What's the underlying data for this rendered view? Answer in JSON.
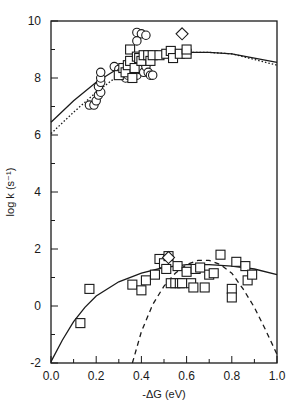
{
  "chart_data": {
    "type": "scatter",
    "title": "",
    "xlabel": "-ΔG (eV)",
    "ylabel": "log k (s⁻¹)",
    "xlim": [
      0.0,
      1.0
    ],
    "ylim": [
      -2,
      10
    ],
    "grid": false,
    "legend": null,
    "x_ticks": [
      0.0,
      0.2,
      0.4,
      0.6,
      0.8,
      1.0
    ],
    "x_tick_labels": [
      "0.0",
      "0.2",
      "0.4",
      "0.6",
      "0.8",
      "1.0"
    ],
    "x_minor_ticks": [
      0.1,
      0.3,
      0.5,
      0.7,
      0.9
    ],
    "y_ticks": [
      -2,
      0,
      2,
      4,
      6,
      8,
      10
    ],
    "y_tick_labels": [
      "-2",
      "0",
      "2",
      "4",
      "6",
      "8",
      "10"
    ],
    "y_minor_ticks": [
      -1,
      1,
      3,
      5,
      7,
      9
    ],
    "series": [
      {
        "name": "upper circles",
        "marker": "circle",
        "points": [
          [
            0.17,
            7.05
          ],
          [
            0.19,
            7.05
          ],
          [
            0.2,
            7.2
          ],
          [
            0.21,
            7.4
          ],
          [
            0.22,
            7.5
          ],
          [
            0.21,
            7.7
          ],
          [
            0.22,
            7.85
          ],
          [
            0.22,
            8.0
          ],
          [
            0.22,
            8.2
          ],
          [
            0.28,
            8.4
          ],
          [
            0.3,
            8.3
          ],
          [
            0.31,
            8.2
          ],
          [
            0.33,
            8.0
          ],
          [
            0.38,
            9.6
          ],
          [
            0.4,
            9.55
          ],
          [
            0.42,
            9.5
          ],
          [
            0.38,
            9.3
          ],
          [
            0.36,
            8.3
          ],
          [
            0.38,
            8.1
          ],
          [
            0.39,
            8.3
          ],
          [
            0.41,
            8.2
          ],
          [
            0.42,
            8.4
          ],
          [
            0.43,
            8.2
          ],
          [
            0.44,
            8.1
          ],
          [
            0.45,
            8.1
          ],
          [
            0.34,
            8.1
          ]
        ]
      },
      {
        "name": "upper squares",
        "marker": "square",
        "points": [
          [
            0.3,
            8.1
          ],
          [
            0.32,
            8.35
          ],
          [
            0.33,
            8.2
          ],
          [
            0.34,
            8.45
          ],
          [
            0.35,
            8.6
          ],
          [
            0.36,
            8.0
          ],
          [
            0.35,
            9.0
          ],
          [
            0.37,
            8.35
          ],
          [
            0.38,
            8.75
          ],
          [
            0.39,
            8.7
          ],
          [
            0.4,
            8.6
          ],
          [
            0.41,
            8.8
          ],
          [
            0.43,
            8.8
          ],
          [
            0.44,
            8.6
          ],
          [
            0.45,
            8.8
          ],
          [
            0.48,
            8.8
          ],
          [
            0.51,
            8.85
          ],
          [
            0.53,
            8.95
          ],
          [
            0.54,
            8.7
          ],
          [
            0.57,
            8.85
          ],
          [
            0.6,
            8.85
          ],
          [
            0.6,
            9.0
          ]
        ]
      },
      {
        "name": "upper diamond",
        "marker": "diamond",
        "points": [
          [
            0.58,
            9.55
          ]
        ]
      },
      {
        "name": "lower squares",
        "marker": "square",
        "points": [
          [
            0.13,
            -0.6
          ],
          [
            0.17,
            0.6
          ],
          [
            0.36,
            0.75
          ],
          [
            0.4,
            0.55
          ],
          [
            0.42,
            0.9
          ],
          [
            0.46,
            1.1
          ],
          [
            0.48,
            1.65
          ],
          [
            0.5,
            1.5
          ],
          [
            0.51,
            1.3
          ],
          [
            0.52,
            1.75
          ],
          [
            0.53,
            0.8
          ],
          [
            0.55,
            0.8
          ],
          [
            0.56,
            1.4
          ],
          [
            0.57,
            0.8
          ],
          [
            0.58,
            0.8
          ],
          [
            0.6,
            1.2
          ],
          [
            0.62,
            0.8
          ],
          [
            0.63,
            0.65
          ],
          [
            0.64,
            1.3
          ],
          [
            0.66,
            1.35
          ],
          [
            0.68,
            0.65
          ],
          [
            0.7,
            1.1
          ],
          [
            0.72,
            1.15
          ],
          [
            0.75,
            1.8
          ],
          [
            0.8,
            0.6
          ],
          [
            0.8,
            0.3
          ],
          [
            0.82,
            1.55
          ],
          [
            0.86,
            1.4
          ],
          [
            0.87,
            0.9
          ],
          [
            0.89,
            1.1
          ]
        ]
      },
      {
        "name": "lower diamond",
        "marker": "diamond",
        "points": [
          [
            0.52,
            1.7
          ]
        ]
      }
    ],
    "curves": [
      {
        "name": "upper fit (solid)",
        "style": "solid",
        "points": [
          [
            0.0,
            6.45
          ],
          [
            0.1,
            7.2
          ],
          [
            0.2,
            7.85
          ],
          [
            0.3,
            8.35
          ],
          [
            0.4,
            8.65
          ],
          [
            0.5,
            8.85
          ],
          [
            0.6,
            8.9
          ],
          [
            0.7,
            8.9
          ],
          [
            0.8,
            8.85
          ],
          [
            0.9,
            8.7
          ],
          [
            1.0,
            8.55
          ]
        ]
      },
      {
        "name": "upper fit (dotted)",
        "style": "dotted",
        "points": [
          [
            0.0,
            6.05
          ],
          [
            0.1,
            6.8
          ],
          [
            0.2,
            7.5
          ],
          [
            0.3,
            8.1
          ],
          [
            0.4,
            8.55
          ],
          [
            0.5,
            8.8
          ],
          [
            0.6,
            8.9
          ],
          [
            0.7,
            8.9
          ],
          [
            0.8,
            8.85
          ],
          [
            0.9,
            8.65
          ],
          [
            1.0,
            8.45
          ]
        ]
      },
      {
        "name": "lower fit (solid)",
        "style": "solid",
        "points": [
          [
            0.0,
            -1.95
          ],
          [
            0.05,
            -1.2
          ],
          [
            0.1,
            -0.55
          ],
          [
            0.15,
            -0.05
          ],
          [
            0.2,
            0.35
          ],
          [
            0.3,
            0.85
          ],
          [
            0.4,
            1.15
          ],
          [
            0.5,
            1.35
          ],
          [
            0.6,
            1.45
          ],
          [
            0.7,
            1.45
          ],
          [
            0.8,
            1.4
          ],
          [
            0.9,
            1.3
          ],
          [
            1.0,
            1.1
          ]
        ]
      },
      {
        "name": "lower fit (dashed)",
        "style": "dashed",
        "points": [
          [
            0.36,
            -2.0
          ],
          [
            0.4,
            -0.9
          ],
          [
            0.45,
            0.05
          ],
          [
            0.5,
            0.7
          ],
          [
            0.55,
            1.15
          ],
          [
            0.6,
            1.45
          ],
          [
            0.65,
            1.6
          ],
          [
            0.7,
            1.6
          ],
          [
            0.75,
            1.45
          ],
          [
            0.8,
            1.15
          ],
          [
            0.85,
            0.6
          ],
          [
            0.9,
            -0.05
          ],
          [
            0.95,
            -0.85
          ],
          [
            1.0,
            -1.7
          ]
        ]
      }
    ],
    "plot_area_px": {
      "left": 51,
      "top": 21,
      "right": 277,
      "bottom": 363
    }
  }
}
